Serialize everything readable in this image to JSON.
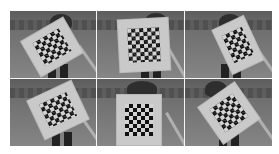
{
  "figure": {
    "layout": {
      "rows": 2,
      "cols": 3
    },
    "panels": [
      {
        "id": "p1",
        "board_rotation_deg": -30,
        "board": {
          "left": 18,
          "top": 16,
          "w": 48,
          "h": 40
        }
      },
      {
        "id": "p2",
        "board_rotation_deg": -3,
        "board": {
          "left": 22,
          "top": 8,
          "w": 50,
          "h": 52
        }
      },
      {
        "id": "p3",
        "board_rotation_deg": -25,
        "board": {
          "left": 36,
          "top": 10,
          "w": 34,
          "h": 48
        }
      },
      {
        "id": "p4",
        "board_rotation_deg": -25,
        "board": {
          "left": 24,
          "top": 10,
          "w": 48,
          "h": 42
        }
      },
      {
        "id": "p5",
        "board_rotation_deg": 0,
        "board": {
          "left": 20,
          "top": 16,
          "w": 44,
          "h": 50
        }
      },
      {
        "id": "p6",
        "board_rotation_deg": -35,
        "board": {
          "left": 22,
          "top": 12,
          "w": 44,
          "h": 44
        }
      }
    ],
    "colors": {
      "background": "#ffffff",
      "divider": "#f4f4f4",
      "board": "#c9c9c9",
      "square_dark": "#111111"
    }
  }
}
